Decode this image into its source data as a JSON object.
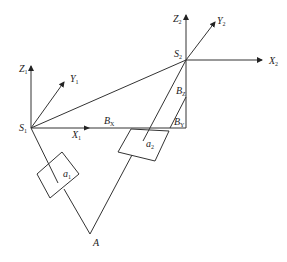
{
  "diagram": {
    "type": "kinematic-frame-diagram",
    "frames": [
      {
        "name": "S1",
        "origin_label": "S",
        "origin_sub": "1",
        "axes": {
          "x": {
            "label": "X",
            "sub": "1"
          },
          "y": {
            "label": "Y",
            "sub": "1"
          },
          "z": {
            "label": "Z",
            "sub": "1"
          }
        }
      },
      {
        "name": "S2",
        "origin_label": "S",
        "origin_sub": "2",
        "axes": {
          "x": {
            "label": "X",
            "sub": "2"
          },
          "y": {
            "label": "Y",
            "sub": "2"
          },
          "z": {
            "label": "Z",
            "sub": "2"
          }
        }
      }
    ],
    "offsets": {
      "bx": {
        "label": "B",
        "sub": "X"
      },
      "by": {
        "label": "B",
        "sub": "Y"
      },
      "bz": {
        "label": "B",
        "sub": "Z"
      }
    },
    "boxes": [
      {
        "label": "a",
        "sub": "1"
      },
      {
        "label": "a",
        "sub": "2"
      }
    ],
    "point_a": {
      "label": "A"
    }
  }
}
